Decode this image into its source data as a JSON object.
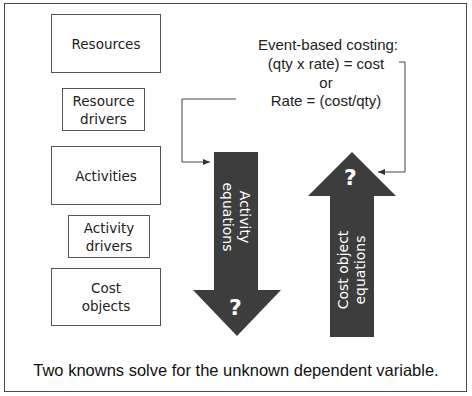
{
  "diagram": {
    "boxes": [
      {
        "label": "Resources"
      },
      {
        "label": "Resource\ndrivers"
      },
      {
        "label": "Activities"
      },
      {
        "label": "Activity\ndrivers"
      },
      {
        "label": "Cost\nobjects"
      }
    ],
    "equations": {
      "line1": "Event-based costing:",
      "line2": "(qty x rate) = cost",
      "line3": "or",
      "line4": "Rate = (cost/qty)"
    },
    "down_arrow": {
      "label": "Activity\nequations",
      "unknown": "?",
      "color": "#3d3d3d"
    },
    "up_arrow": {
      "label": "Cost object\nequations",
      "unknown": "?",
      "color": "#3d3d3d"
    },
    "footer": "Two knowns solve for the unknown dependent variable."
  }
}
